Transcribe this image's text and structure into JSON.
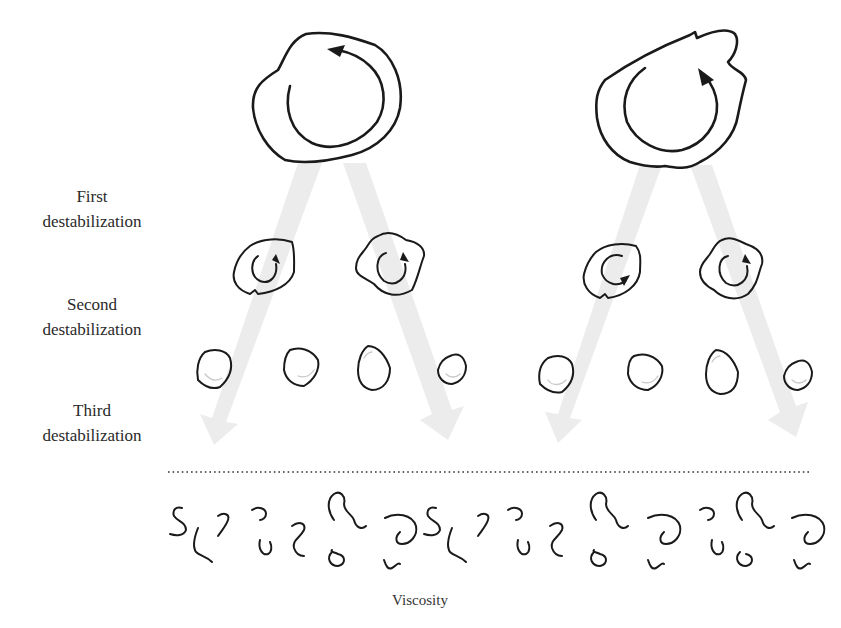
{
  "diagram": {
    "type": "energy-cascade",
    "stage_labels": [
      {
        "id": "first",
        "line1": "First",
        "line2": "destabilization"
      },
      {
        "id": "second",
        "line1": "Second",
        "line2": "destabilization"
      },
      {
        "id": "third",
        "line1": "Third",
        "line2": "destabilization"
      }
    ],
    "caption": "Viscosity",
    "cascades": [
      {
        "name": "left-cascade",
        "large_eddy": {
          "count": 1,
          "rotation_arrow": true
        },
        "medium_eddies": {
          "count": 2,
          "rotation_arrows": true
        },
        "small_eddies": {
          "count": 4
        }
      },
      {
        "name": "right-cascade",
        "large_eddy": {
          "count": 1,
          "rotation_arrow": true
        },
        "medium_eddies": {
          "count": 2,
          "rotation_arrows": true
        },
        "small_eddies": {
          "count": 4
        }
      }
    ],
    "dissipation_squiggles": {
      "count": 20,
      "pattern_repeats": 2
    },
    "divider": "dotted-line",
    "colors": {
      "ink": "#1a1a1a",
      "cascade_arrow": "#ececec",
      "background": "#ffffff"
    }
  }
}
